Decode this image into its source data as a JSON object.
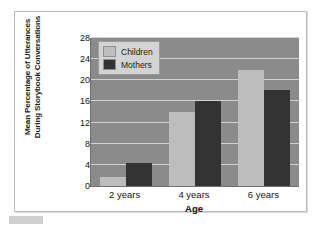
{
  "figure": {
    "y_axis_title_line1": "Mean Percentage of Utterances",
    "y_axis_title_line2": "During Storybook Conversations",
    "x_axis_title": "Age"
  },
  "legend": {
    "position": "inside-top-left",
    "entries": [
      {
        "label": "Children",
        "color": "#bdbdbd",
        "swatch_name": "children"
      },
      {
        "label": "Mothers",
        "color": "#333333",
        "swatch_name": "mothers"
      }
    ]
  },
  "colors": {
    "plot_background": "#8b8b8b",
    "gridline": "#d2d2d2",
    "children_bar": "#bdbdbd",
    "mothers_bar": "#333333",
    "frame_border": "#b9bcc2",
    "axis_line": "#6f6f6f",
    "legend_background": "#d3d3d3"
  },
  "chart_data": {
    "type": "bar",
    "title": "",
    "subtitle": "",
    "xlabel": "Age",
    "ylabel": "Mean Percentage of Utterances During Storybook Conversations",
    "categories": [
      "2 years",
      "4 years",
      "6 years"
    ],
    "series": [
      {
        "name": "Children",
        "values": [
          1.8,
          14.0,
          22.0
        ],
        "color": "#bdbdbd"
      },
      {
        "name": "Mothers",
        "values": [
          4.4,
          16.1,
          18.2
        ],
        "color": "#333333"
      }
    ],
    "ylim": [
      0,
      28
    ],
    "ytick_labels": [
      "0",
      "4",
      "8",
      "12",
      "16",
      "20",
      "24",
      "28"
    ],
    "ytick_values": [
      0,
      4,
      8,
      12,
      16,
      20,
      24,
      28
    ],
    "grid": true,
    "grid_axis": "y",
    "legend_position": "upper left inside plot",
    "annotations": []
  }
}
